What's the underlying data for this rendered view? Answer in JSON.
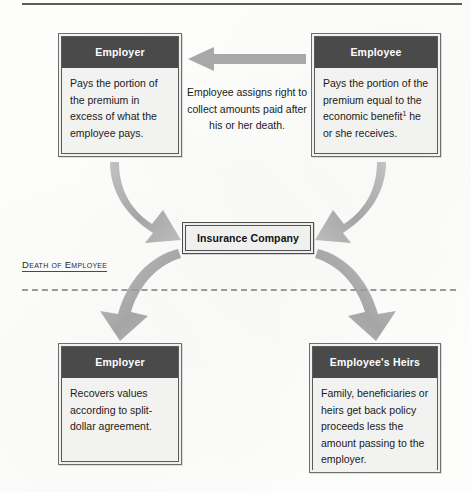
{
  "diagram": {
    "colors": {
      "header_fill": "#4a4a4a",
      "header_text": "#ffffff",
      "body_fill": "#f2f2f0",
      "arrow_gray": "#a9a9a9",
      "divider_gray": "#9a9a9a",
      "page_background": "#fdfdfc"
    },
    "top_row": {
      "employer": {
        "header": "Employer",
        "body": "Pays the portion of the premium in excess of what the employee pays."
      },
      "employee": {
        "header": "Employee",
        "body_before_footnote": "Pays the portion of the premium equal to the economic benefit",
        "footnote_marker": "1",
        "body_after_footnote": " he or she receives."
      },
      "assignment_arrow": {
        "direction": "left",
        "caption": "Employee assigns right to collect amounts paid after his or her death."
      }
    },
    "center": {
      "insurance_company": "Insurance Company"
    },
    "divider": {
      "label": "Death of Employee",
      "style": "dashed"
    },
    "bottom_row": {
      "employer": {
        "header": "Employer",
        "body": "Recovers values according to split-dollar agreement."
      },
      "heirs": {
        "header": "Employee's Heirs",
        "body": "Family, beneficiaries or heirs get back policy proceeds less the amount passing to the employer."
      }
    },
    "flows": [
      {
        "from": "Employer",
        "to": "Insurance Company",
        "shape": "curve-down-right"
      },
      {
        "from": "Employee",
        "to": "Insurance Company",
        "shape": "curve-down-left"
      },
      {
        "from": "Insurance Company",
        "to": "Employer",
        "shape": "curve-down-left"
      },
      {
        "from": "Insurance Company",
        "to": "Employee's Heirs",
        "shape": "curve-down-right"
      }
    ]
  }
}
